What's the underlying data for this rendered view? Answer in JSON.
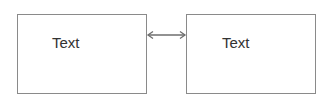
{
  "diagram": {
    "nodes": [
      {
        "id": "node-1",
        "label": "Text"
      },
      {
        "id": "node-2",
        "label": "Text"
      }
    ],
    "edges": [
      {
        "from": "node-1",
        "to": "node-2",
        "direction": "bidirectional"
      }
    ],
    "colors": {
      "border": "#8a8a8a",
      "text": "#333333",
      "arrow": "#6e6e6e",
      "background": "#ffffff"
    }
  }
}
